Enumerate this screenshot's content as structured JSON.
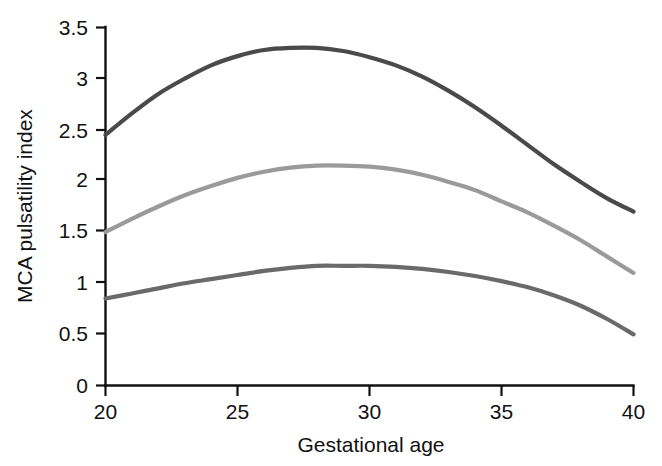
{
  "chart_data": {
    "type": "line",
    "title": "",
    "subtitle": "",
    "xlabel": "Gestational age",
    "ylabel": "MCA pulsatility index",
    "xlim": [
      20,
      40
    ],
    "ylim": [
      0,
      3.5
    ],
    "grid": false,
    "legend": "none",
    "x_ticks": [
      "20",
      "25",
      "30",
      "35",
      "40"
    ],
    "x_tick_values": [
      20,
      25,
      30,
      35,
      40
    ],
    "y_ticks": [
      "0",
      "0.5",
      "1",
      "1.5",
      "2",
      "2.5",
      "3",
      "3.5"
    ],
    "y_tick_values": [
      0,
      0.5,
      1,
      1.5,
      2,
      2.5,
      3,
      3.5
    ],
    "x": [
      20,
      21,
      22,
      23,
      24,
      25,
      26,
      27,
      28,
      29,
      30,
      31,
      32,
      33,
      34,
      35,
      36,
      37,
      38,
      39,
      40
    ],
    "series": [
      {
        "name": "upper reference curve",
        "color": "#4a4a4a",
        "values": [
          2.45,
          2.66,
          2.85,
          3.0,
          3.13,
          3.22,
          3.28,
          3.3,
          3.3,
          3.27,
          3.21,
          3.13,
          3.02,
          2.88,
          2.72,
          2.54,
          2.35,
          2.16,
          1.99,
          1.83,
          1.7
        ]
      },
      {
        "name": "median reference curve",
        "color": "#9a9a9a",
        "values": [
          1.5,
          1.63,
          1.75,
          1.86,
          1.95,
          2.03,
          2.09,
          2.13,
          2.15,
          2.15,
          2.14,
          2.11,
          2.06,
          1.99,
          1.91,
          1.8,
          1.69,
          1.56,
          1.42,
          1.26,
          1.1
        ]
      },
      {
        "name": "lower reference curve",
        "color": "#6a6a6a",
        "values": [
          0.85,
          0.9,
          0.95,
          1.0,
          1.04,
          1.08,
          1.12,
          1.15,
          1.17,
          1.17,
          1.17,
          1.16,
          1.14,
          1.11,
          1.07,
          1.02,
          0.96,
          0.88,
          0.78,
          0.65,
          0.5
        ]
      }
    ],
    "annotations": []
  },
  "axes": {
    "y_axis_title": "MCA pulsatility index",
    "x_axis_title": "Gestational age",
    "y_labels": {
      "t0": "0",
      "t1": "0.5",
      "t2": "1",
      "t3": "1.5",
      "t4": "2",
      "t5": "2.5",
      "t6": "3",
      "t7": "3.5"
    },
    "x_labels": {
      "t0": "20",
      "t1": "25",
      "t2": "30",
      "t3": "35",
      "t4": "40"
    }
  },
  "colors": {
    "upper_curve": "#4a4a4a",
    "median_curve": "#9a9a9a",
    "lower_curve": "#6a6a6a",
    "axis": "#111111",
    "background": "#ffffff"
  }
}
